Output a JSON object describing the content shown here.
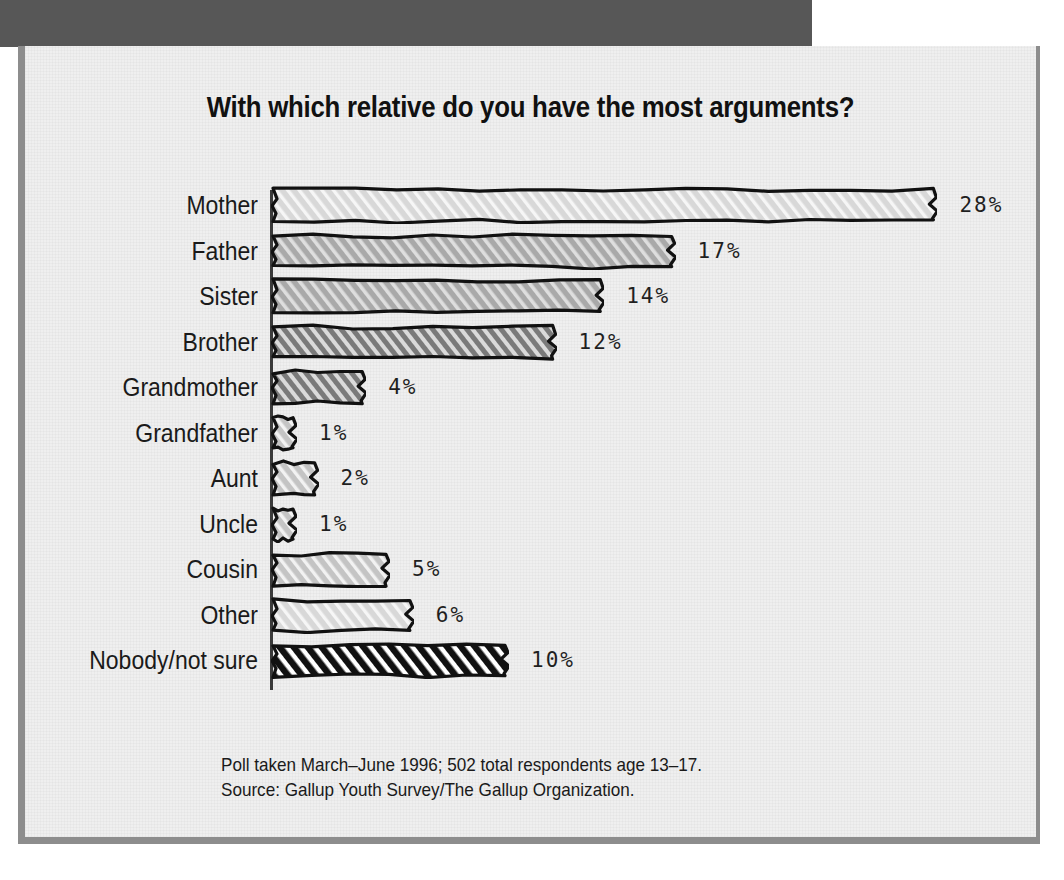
{
  "chart_data": {
    "type": "bar",
    "orientation": "horizontal",
    "title": "With which relative do you have the most arguments?",
    "xlabel": "",
    "ylabel": "",
    "categories": [
      "Mother",
      "Father",
      "Sister",
      "Brother",
      "Grandmother",
      "Grandfather",
      "Aunt",
      "Uncle",
      "Cousin",
      "Other",
      "Nobody/not sure"
    ],
    "values": [
      28,
      17,
      14,
      12,
      4,
      1,
      2,
      1,
      5,
      6,
      10
    ],
    "value_labels": [
      "28%",
      "17%",
      "14%",
      "12%",
      "4%",
      "1%",
      "2%",
      "1%",
      "5%",
      "6%",
      "10%"
    ],
    "xlim": [
      0,
      28
    ],
    "grid": false,
    "legend": null,
    "units": "percent",
    "bar_styles": [
      {
        "fill": "#d8d8d8",
        "hatch": "diagonal-light"
      },
      {
        "fill": "#a9a9a9",
        "hatch": "diagonal-medium"
      },
      {
        "fill": "#a9a9a9",
        "hatch": "diagonal-medium"
      },
      {
        "fill": "#7a7a7a",
        "hatch": "diagonal-dark"
      },
      {
        "fill": "#7a7a7a",
        "hatch": "diagonal-dark"
      },
      {
        "fill": "#c4c4c4",
        "hatch": "diagonal-light"
      },
      {
        "fill": "#c4c4c4",
        "hatch": "diagonal-light"
      },
      {
        "fill": "#c4c4c4",
        "hatch": "diagonal-light"
      },
      {
        "fill": "#c4c4c4",
        "hatch": "diagonal-light"
      },
      {
        "fill": "#d8d8d8",
        "hatch": "diagonal-light"
      },
      {
        "fill": "#1a1a1a",
        "hatch": "diagonal-black"
      }
    ]
  },
  "footnote": {
    "line1": "Poll taken March–June 1996; 502 total respondents age 13–17.",
    "line2": "Source: Gallup Youth Survey/The Gallup Organization."
  },
  "colors": {
    "paper": "#efefef",
    "band": "#575757",
    "frame": "#8d8d8d",
    "ink": "#1a1a1a"
  }
}
